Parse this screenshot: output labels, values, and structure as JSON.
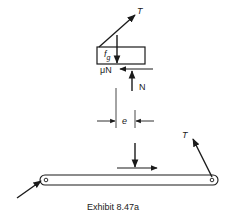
{
  "diagram": {
    "type": "free-body-diagram",
    "caption": "Exhibit 8.47a",
    "upper_block": {
      "tension_label": "T",
      "weight_label": "f",
      "weight_subscript": "g",
      "friction_label": "μN",
      "normal_label": "N",
      "eccentricity_label": "e"
    },
    "lower_bar": {
      "tension_label": "T"
    },
    "colors": {
      "stroke": "#1a1a1a",
      "background": "#ffffff"
    }
  }
}
